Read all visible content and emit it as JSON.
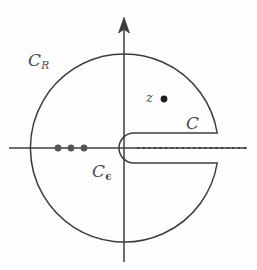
{
  "figure": {
    "type": "complex-contour-diagram",
    "background_color": "#fefefe",
    "stroke_color": "#3c3c3c",
    "labels": {
      "outer_circle": {
        "base": "C",
        "sub": "R",
        "text": "C_R"
      },
      "inner_circle": {
        "base": "C",
        "sub": "ϵ",
        "text": "C_ϵ"
      },
      "contour": {
        "base": "C",
        "sub": "",
        "text": "C"
      },
      "point": {
        "base": "z",
        "sub": "",
        "text": "z"
      }
    },
    "geometry": {
      "vertical_axis": {
        "x": 124,
        "y_top": 18,
        "y_bottom": 262,
        "arrow": "up"
      },
      "horizontal_axis": {
        "y": 148,
        "x_left": 9,
        "x_right": 247
      },
      "outer_circle": {
        "cx": 124,
        "cy": 147,
        "r": 94
      },
      "inner_semicircle": {
        "cx": 134,
        "cy": 148,
        "r": 15,
        "opens": "right"
      },
      "slit": {
        "y_top": 133,
        "y_bottom": 163,
        "x_start": 134,
        "x_end": 217
      },
      "branch_cut_dotted": {
        "y": 148,
        "x_start": 137,
        "x_end": 247
      },
      "marked_point_z": {
        "cx": 164,
        "cy": 99,
        "r": 3.4
      },
      "real_axis_dots": [
        {
          "cx": 58,
          "cy": 148,
          "r": 3.4
        },
        {
          "cx": 71,
          "cy": 148,
          "r": 3.4
        },
        {
          "cx": 84,
          "cy": 148,
          "r": 3.4
        }
      ]
    }
  }
}
